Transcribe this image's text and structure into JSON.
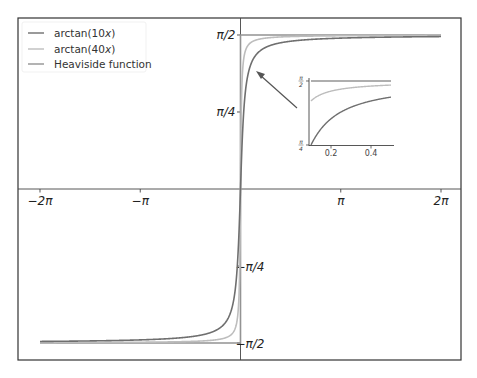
{
  "chart_data": {
    "type": "line",
    "title": "",
    "xlabel": "",
    "ylabel": "",
    "xlim": [
      -6.2832,
      6.2832
    ],
    "ylim": [
      -1.5708,
      1.5708
    ],
    "grid": false,
    "legend_position": "upper left",
    "x_ticks": [
      {
        "value": -6.2832,
        "label": "−2π"
      },
      {
        "value": -3.1416,
        "label": "−π"
      },
      {
        "value": 3.1416,
        "label": "π"
      },
      {
        "value": 6.2832,
        "label": "2π"
      }
    ],
    "y_ticks": [
      {
        "value": 1.5708,
        "label": "π/2"
      },
      {
        "value": 0.7854,
        "label": "π/4"
      },
      {
        "value": -0.7854,
        "label": "−π/4"
      },
      {
        "value": -1.5708,
        "label": "−π/2"
      }
    ],
    "series": [
      {
        "name": "arctan(10x)",
        "function": "arctan(10*x)",
        "color": "#6f6f6f"
      },
      {
        "name": "arctan(40x)",
        "function": "arctan(40*x)",
        "color": "#bdbdbd"
      },
      {
        "name": "Heaviside function",
        "function": "(pi/2)*sign(x)",
        "color": "#939393"
      }
    ],
    "inset": {
      "xlim": [
        0.1,
        0.5
      ],
      "ylim": [
        0.7854,
        1.5708
      ],
      "x_ticks": [
        {
          "value": 0.2,
          "label": "0.2"
        },
        {
          "value": 0.4,
          "label": "0.4"
        }
      ],
      "y_ticks": [
        {
          "value": 1.5708,
          "label_num": "π",
          "label_den": "2"
        },
        {
          "value": 0.7854,
          "label_num": "π",
          "label_den": "4"
        }
      ],
      "annotation": "arrow pointing from inset to the region near x≈0.1–0.5, y≈π/4–π/2"
    }
  },
  "legend": {
    "items": [
      {
        "label": "arctan(10x)",
        "prefix": "arctan(10",
        "var": "x",
        "suffix": ")"
      },
      {
        "label": "arctan(40x)",
        "prefix": "arctan(40",
        "var": "x",
        "suffix": ")"
      },
      {
        "label": "Heaviside function"
      }
    ]
  }
}
